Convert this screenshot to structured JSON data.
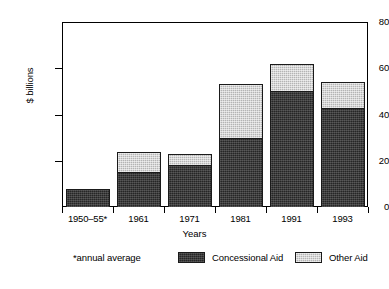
{
  "chart_data": {
    "type": "bar",
    "subtype": "stacked-vertical",
    "title": "",
    "xlabel": "Years",
    "ylabel": "$ billions",
    "categories": [
      "1950–55*",
      "1961",
      "1971",
      "1981",
      "1991",
      "1993"
    ],
    "series": [
      {
        "name": "Concessional Aid",
        "values": [
          8,
          15,
          18,
          30,
          50,
          43
        ],
        "color": "#262626"
      },
      {
        "name": "Other Aid",
        "values": [
          0,
          9,
          5,
          23,
          12,
          11
        ],
        "color": "#b4b4b4"
      }
    ],
    "totals": [
      8,
      24,
      23,
      53,
      62,
      54
    ],
    "ylim": [
      0,
      80
    ],
    "yticks": [
      0,
      20,
      40,
      60,
      80
    ],
    "ytick_labels": [
      "0",
      "20",
      "40",
      "60",
      "80"
    ],
    "grid": false,
    "legend_position": "bottom",
    "annotations": [
      "*annual average"
    ]
  },
  "axes": {
    "y_title": "$ billions",
    "x_title": "Years"
  },
  "legend": {
    "footnote": "*annual average",
    "entries": [
      {
        "label": "Concessional Aid"
      },
      {
        "label": "Other Aid"
      }
    ]
  }
}
